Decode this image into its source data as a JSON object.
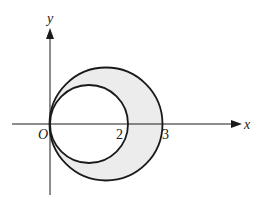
{
  "diagram": {
    "axes": {
      "x_label": "x",
      "y_label": "y",
      "origin_label": "O"
    },
    "ticks": [
      {
        "value": 2,
        "label": "2"
      },
      {
        "value": 3,
        "label": "3"
      }
    ],
    "circles": [
      {
        "name": "large",
        "center": [
          1.5,
          0
        ],
        "radius": 1.5,
        "passes_through": [
          [
            0,
            0
          ],
          [
            3,
            0
          ]
        ]
      },
      {
        "name": "small",
        "center": [
          1,
          0
        ],
        "radius": 1,
        "passes_through": [
          [
            0,
            0
          ],
          [
            2,
            0
          ]
        ]
      }
    ],
    "shaded_region": "area inside large circle and outside small circle",
    "colors": {
      "stroke": "#1a1a1a",
      "shade": "#ececec"
    }
  }
}
